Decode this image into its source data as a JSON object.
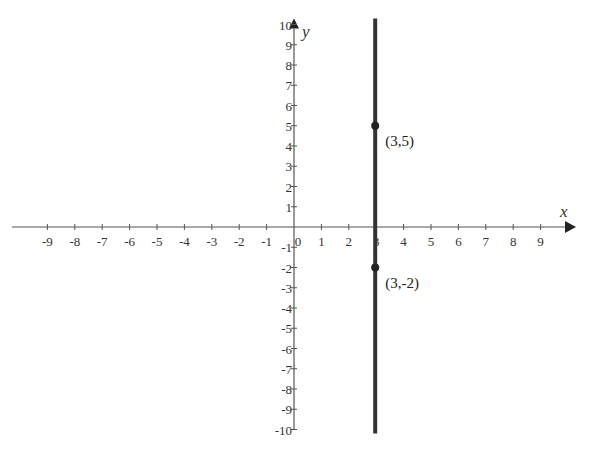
{
  "chart_data": {
    "type": "line",
    "title": "",
    "xlabel": "x",
    "ylabel": "y",
    "xlim": [
      -10,
      10
    ],
    "ylim": [
      -10,
      10
    ],
    "grid": false,
    "x_ticks": [
      -9,
      -8,
      -7,
      -6,
      -5,
      -4,
      -3,
      -2,
      -1,
      0,
      1,
      2,
      3,
      4,
      5,
      6,
      7,
      8,
      9
    ],
    "y_ticks": [
      -10,
      -9,
      -8,
      -7,
      -6,
      -5,
      -4,
      -3,
      -2,
      -1,
      1,
      2,
      3,
      4,
      5,
      6,
      7,
      8,
      9,
      10
    ],
    "series": [
      {
        "name": "x = 3",
        "type": "vertical-line",
        "x": 3,
        "y_range": [
          -10,
          10
        ],
        "color": "#333333"
      }
    ],
    "points": [
      {
        "x": 3,
        "y": 5,
        "label": "(3,5)"
      },
      {
        "x": 3,
        "y": -2,
        "label": "(3,-2)"
      }
    ]
  },
  "labels": {
    "x_axis": "x",
    "y_axis": "y",
    "p1": "(3,5)",
    "p2": "(3,-2)"
  }
}
